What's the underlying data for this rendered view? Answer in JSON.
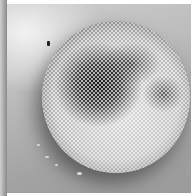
{
  "image": {
    "description": "Grayscale micrograph of a spherical object covered with a hexagonal dot lattice, with dark irregular patches",
    "colors": {
      "background": "#bdbdbd",
      "sphere_light": "#d9d9d9",
      "sphere_dark": "#141414",
      "border": "#ffffff"
    }
  }
}
